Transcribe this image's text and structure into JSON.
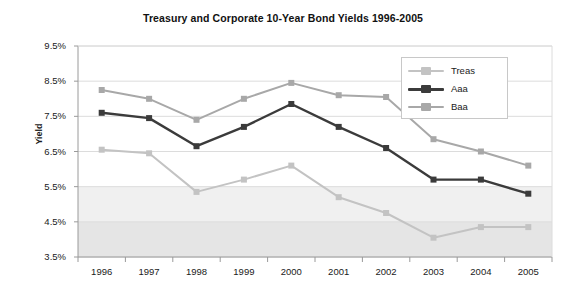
{
  "chart_data": {
    "type": "line",
    "title": "Treasury and Corporate 10-Year Bond Yields 1996-2005",
    "xlabel": "",
    "ylabel": "Yield",
    "categories": [
      "1996",
      "1997",
      "1998",
      "1999",
      "2000",
      "2001",
      "2002",
      "2003",
      "2004",
      "2005"
    ],
    "ylim": [
      3.5,
      9.5
    ],
    "ytick_labels": [
      "9.5%",
      "8.5%",
      "7.5%",
      "6.5%",
      "5.5%",
      "4.5%",
      "3.5%"
    ],
    "ytick_values": [
      9.5,
      8.5,
      7.5,
      6.5,
      5.5,
      4.5,
      3.5
    ],
    "grid": true,
    "legend_position": "top-right",
    "series": [
      {
        "name": "Treas",
        "color": "#c3c3c3",
        "values": [
          6.55,
          6.45,
          5.35,
          5.7,
          6.1,
          5.2,
          4.75,
          4.05,
          4.35,
          4.35
        ]
      },
      {
        "name": "Aaa",
        "color": "#3b3b3b",
        "values": [
          7.6,
          7.45,
          6.65,
          7.2,
          7.85,
          7.2,
          6.6,
          5.7,
          5.7,
          5.3
        ]
      },
      {
        "name": "Baa",
        "color": "#a8a8a8",
        "values": [
          8.25,
          8.0,
          7.4,
          8.0,
          8.45,
          8.1,
          8.05,
          6.85,
          6.5,
          6.1
        ]
      }
    ]
  },
  "legend": {
    "items": [
      {
        "label": "Treas"
      },
      {
        "label": "Aaa"
      },
      {
        "label": "Baa"
      }
    ]
  },
  "colors": {
    "treas": "#c3c3c3",
    "aaa": "#3b3b3b",
    "baa": "#a8a8a8",
    "grid": "#dcdcdc",
    "axis": "#9a9a9a",
    "band_low": "#dcdcdc",
    "band_mid": "#ebebeb",
    "plot_bg": "#ffffff"
  }
}
